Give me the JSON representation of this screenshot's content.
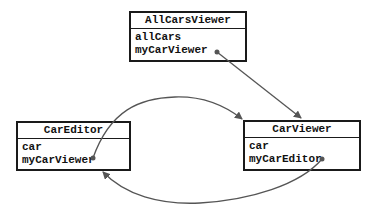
{
  "classes": [
    {
      "name": "AllCarsViewer",
      "fields": [
        "allCars",
        "myCarViewer"
      ]
    },
    {
      "name": "CarEditor",
      "fields": [
        "car",
        "myCarViewer"
      ]
    },
    {
      "name": "CarViewer",
      "fields": [
        "car",
        "myCarEditor"
      ]
    }
  ],
  "references": [
    {
      "from": "AllCarsViewer.myCarViewer",
      "to": "CarViewer"
    },
    {
      "from": "CarEditor.myCarViewer",
      "to": "CarViewer"
    },
    {
      "from": "CarViewer.myCarEditor",
      "to": "CarEditor"
    }
  ],
  "colors": {
    "line": "#555555",
    "border": "#1a1a1a"
  }
}
